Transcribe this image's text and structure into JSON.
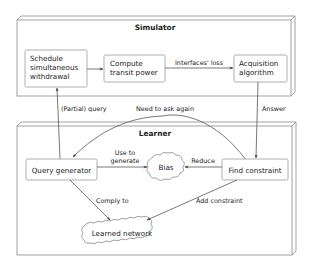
{
  "simulator": {
    "title": "Simulator",
    "nodes": {
      "schedule": [
        "Schedule",
        "simultaneous",
        "withdrawal"
      ],
      "compute": [
        "Compute",
        "transit power"
      ],
      "acquisition": [
        "Acquisition",
        "algorithm"
      ]
    },
    "edges": {
      "compute_to_acquisition": "Interfaces' loss"
    }
  },
  "learner": {
    "title": "Learner",
    "nodes": {
      "query_generator": "Query generator",
      "bias": "Bias",
      "find_constraint": "Find constraint",
      "learned_network": "Learned network"
    },
    "edges": {
      "use_to_generate": [
        "Use to",
        "generate"
      ],
      "reduce": "Reduce",
      "comply_to": "Comply to",
      "add_constraint": "Add constraint"
    }
  },
  "cross_edges": {
    "partial_query": "(Partial) query",
    "need_to_ask_again": "Need to ask again",
    "answer": "Answer"
  },
  "colors": {
    "line": "#555555",
    "frame": "#8a8a8a",
    "text": "#222222",
    "background": "#ffffff"
  }
}
